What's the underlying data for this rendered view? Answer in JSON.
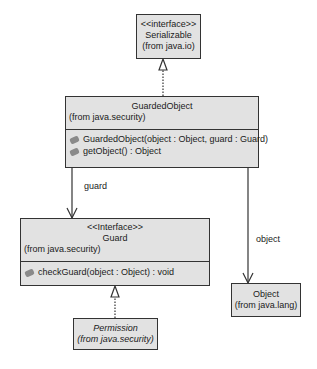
{
  "classes": {
    "serializable": {
      "stereotype": "<<interface>>",
      "name": "Serializable",
      "package": "(from java.io)"
    },
    "guarded_object": {
      "name": "GuardedObject",
      "package": "(from java.security)",
      "operations": [
        "GuardedObject(object : Object, guard : Guard)",
        "getObject() : Object"
      ]
    },
    "guard": {
      "stereotype": "<<Interface>>",
      "name": "Guard",
      "package": "(from java.security)",
      "operations": [
        "checkGuard(object : Object) : void"
      ]
    },
    "permission": {
      "name": "Permission",
      "package": "(from java.security)"
    },
    "object": {
      "name": "Object",
      "package": "(from java.lang)"
    }
  },
  "associations": {
    "guard_label": "guard",
    "object_label": "object"
  },
  "colors": {
    "box_fill": "#e2e2e2",
    "border": "#333333",
    "text": "#1a1a1a"
  }
}
